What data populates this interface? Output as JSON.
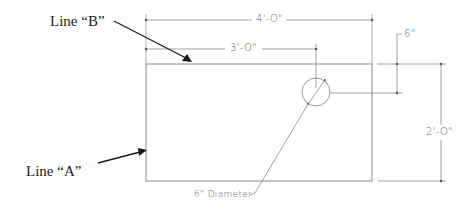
{
  "diagram": {
    "type": "dimensioned-drawing",
    "callouts": {
      "line_b": {
        "label": "Line “B”"
      },
      "line_a": {
        "label": "Line “A”"
      }
    },
    "dimensions": {
      "overall_width": "4'-O\"",
      "hole_offset_x": "3'-O\"",
      "hole_offset_y": "6\"",
      "overall_height": "2'-O\""
    },
    "hole": {
      "label": "6\" Diameter"
    },
    "colors": {
      "line": "#7a7a7a",
      "arrow": "#1a1a1a",
      "text": "#1a1a1a",
      "dim_text": "#666666"
    }
  }
}
